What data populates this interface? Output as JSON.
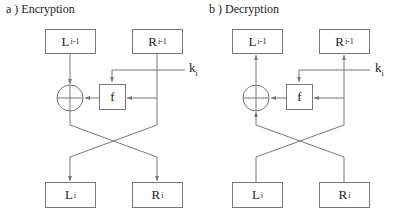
{
  "panels": [
    {
      "id": "encryption",
      "title": "a )  Encryption",
      "top_left": {
        "base": "L",
        "sub": "i-1"
      },
      "top_right": {
        "base": "R",
        "sub": "i-1"
      },
      "bottom_left": {
        "base": "L",
        "sub": "i"
      },
      "bottom_right": {
        "base": "R",
        "sub": "i"
      },
      "function": "f",
      "key": {
        "base": "k",
        "sub": "i"
      },
      "operator": "xor"
    },
    {
      "id": "decryption",
      "title": "b )  Decryption",
      "top_left": {
        "base": "L",
        "sub": "i-1"
      },
      "top_right": {
        "base": "R",
        "sub": "i-1"
      },
      "bottom_left": {
        "base": "L",
        "sub": "i"
      },
      "bottom_right": {
        "base": "R",
        "sub": "i"
      },
      "function": "f",
      "key": {
        "base": "k",
        "sub": "i"
      },
      "operator": "xor"
    }
  ],
  "colors": {
    "line": "#777777",
    "text": "#222222"
  }
}
